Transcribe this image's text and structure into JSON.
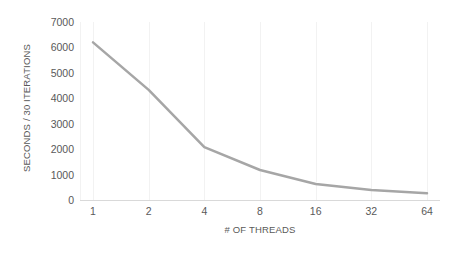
{
  "chart_data": {
    "type": "line",
    "title": "",
    "subtitle": "",
    "xlabel": "# OF THREADS",
    "ylabel": "SECONDS / 30 ITERATIONS",
    "categories": [
      "1",
      "2",
      "4",
      "8",
      "16",
      "32",
      "64"
    ],
    "values": [
      6200,
      4330,
      2080,
      1180,
      630,
      390,
      270
    ],
    "series": [
      {
        "name": "",
        "values": [
          6200,
          4330,
          2080,
          1180,
          630,
          390,
          270
        ]
      }
    ],
    "ylim": [
      0,
      7000
    ],
    "y_ticks": [
      7000,
      6000,
      5000,
      4000,
      3000,
      2000,
      1000,
      0
    ],
    "y_tick_labels": [
      "7000",
      "6000",
      "5000",
      "4000",
      "3000",
      "2000",
      "1000",
      "0"
    ],
    "x_tick_labels": [
      "1",
      "2",
      "4",
      "8",
      "16",
      "32",
      "64"
    ],
    "grid": {
      "vertical": true,
      "horizontal": false
    },
    "legend": {
      "visible": false,
      "position": "none"
    },
    "colors": {
      "line": "#a6a6a6",
      "grid": "#f2f2f2",
      "axis": "#d9d9d9",
      "text": "#595959",
      "background": "#ffffff"
    },
    "line_width": 2.5
  }
}
